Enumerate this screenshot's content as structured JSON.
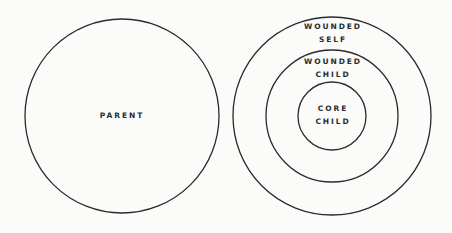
{
  "diagram": {
    "stroke_color": "#2a2a2a",
    "background": "#fbfbfa",
    "left": {
      "label": "PARENT",
      "circle": {
        "cx": 122,
        "cy": 116,
        "r": 97
      }
    },
    "right": {
      "rings": [
        {
          "name": "wounded-self",
          "cx": 332,
          "cy": 116,
          "r": 99,
          "label_line1": "WOUNDED",
          "label_line2": "SELF"
        },
        {
          "name": "wounded-child",
          "cx": 332,
          "cy": 116,
          "r": 66,
          "label_line1": "WOUNDED",
          "label_line2": "CHILD"
        },
        {
          "name": "core-child",
          "cx": 332,
          "cy": 116,
          "r": 34,
          "label_line1": "CORE",
          "label_line2": "CHILD"
        }
      ]
    }
  }
}
